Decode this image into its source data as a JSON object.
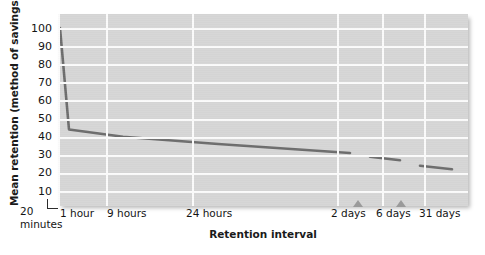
{
  "chart_data": {
    "type": "line",
    "title": "",
    "xlabel": "Retention interval",
    "ylabel": "Mean retention (method of savings)",
    "ylim": [
      0,
      105
    ],
    "yticks": [
      100,
      90,
      80,
      70,
      60,
      50,
      40,
      30,
      20,
      10
    ],
    "grid": true,
    "legend": null,
    "axis_origin_label": {
      "value": "20",
      "unit": "minutes"
    },
    "xticks": [
      "1 hour",
      "9 hours",
      "24 hours",
      "2 days",
      "6 days",
      "31 days"
    ],
    "axis_breaks": [
      "between 2 days and 6 days",
      "between 6 days and 31 days"
    ],
    "note": "Ebbinghaus forgetting curve: percent savings versus retention interval on a compressed (broken) time axis.",
    "series": [
      {
        "name": "Mean retention (% savings)",
        "color": "#6d6d6d",
        "segments": [
          {
            "name": "main-curve",
            "points": [
              {
                "x": "20 minutes",
                "y": 100
              },
              {
                "x": "1 hour",
                "y": 44
              },
              {
                "x": "9 hours",
                "y": 40
              },
              {
                "x": "24 hours",
                "y": 36
              },
              {
                "x": "2 days",
                "y": 31
              }
            ]
          },
          {
            "name": "6-day-segment",
            "points": [
              {
                "x": "6 days pre",
                "y": 29
              },
              {
                "x": "6 days post",
                "y": 27
              }
            ]
          },
          {
            "name": "31-day-segment",
            "points": [
              {
                "x": "31 days pre",
                "y": 24
              },
              {
                "x": "31 days post",
                "y": 22
              }
            ]
          }
        ]
      }
    ]
  },
  "colors": {
    "plot_background": "#d6d6d6",
    "gridline": "#fbfbfb",
    "curve": "#6d6d6d",
    "text": "#141414"
  }
}
